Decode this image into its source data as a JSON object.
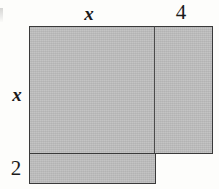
{
  "figure": {
    "type": "geometry-diagram",
    "background_color": "#fdfdfb",
    "fill_color": "#bcbcbc",
    "stroke_color": "#3a3a3a",
    "text_color": "#1a1a1a",
    "labels": {
      "top_left": "x",
      "top_right": "4",
      "left_middle": "x",
      "left_bottom": "2"
    },
    "regions": [
      {
        "name": "main-square",
        "width_label": "x",
        "height_label": "x",
        "x": 29,
        "y": 26,
        "w": 126,
        "h": 128
      },
      {
        "name": "right-rectangle",
        "width_label": "4",
        "height_label": "x",
        "x": 154,
        "y": 26,
        "w": 59,
        "h": 128
      },
      {
        "name": "bottom-strip",
        "width_label": "x",
        "height_label": "2",
        "x": 29,
        "y": 153,
        "w": 127,
        "h": 31
      }
    ]
  }
}
